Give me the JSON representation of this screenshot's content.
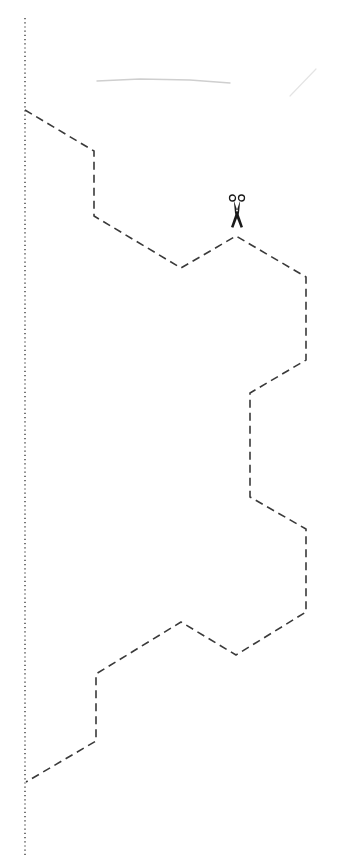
{
  "page": {
    "width": 337,
    "height": 855,
    "background": "#ffffff"
  },
  "fold_line": {
    "style": "dotted",
    "color": "#555555",
    "x": 25,
    "y_start": 18,
    "y_end": 855
  },
  "cut_line": {
    "style": "dashed",
    "color": "#3a3a3a",
    "points": [
      [
        25,
        110
      ],
      [
        94,
        151
      ],
      [
        94,
        216
      ],
      [
        181,
        268
      ],
      [
        236,
        236
      ],
      [
        306,
        277
      ],
      [
        306,
        360
      ],
      [
        250,
        393
      ],
      [
        250,
        497
      ],
      [
        306,
        529
      ],
      [
        306,
        612
      ],
      [
        236,
        655
      ],
      [
        181,
        622
      ],
      [
        96,
        674
      ],
      [
        96,
        741
      ],
      [
        26,
        782
      ]
    ]
  },
  "scissors": {
    "icon": "scissors-icon",
    "x": 237,
    "y": 214,
    "color": "#1a1a1a"
  },
  "smudges": [
    {
      "points": [
        [
          97,
          81
        ],
        [
          140,
          79
        ],
        [
          190,
          80
        ],
        [
          230,
          83
        ]
      ]
    },
    {
      "points": [
        [
          290,
          96
        ],
        [
          316,
          69
        ]
      ]
    }
  ]
}
